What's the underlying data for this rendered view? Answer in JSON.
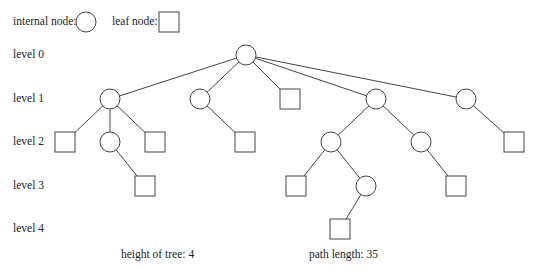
{
  "legend": {
    "internal_label": "internal node:",
    "leaf_label": "leaf node:"
  },
  "levels": [
    "level 0",
    "level 1",
    "level 2",
    "level 3",
    "level 4"
  ],
  "footer": {
    "height": "height of tree: 4",
    "path_length": "path length: 35"
  },
  "tree": {
    "nodes": [
      {
        "id": "r",
        "type": "internal",
        "x": 246,
        "y": 55
      },
      {
        "id": "a",
        "type": "internal",
        "x": 110,
        "y": 99
      },
      {
        "id": "b",
        "type": "internal",
        "x": 200,
        "y": 99
      },
      {
        "id": "c",
        "type": "leaf",
        "x": 290,
        "y": 99
      },
      {
        "id": "d",
        "type": "internal",
        "x": 376,
        "y": 99
      },
      {
        "id": "e",
        "type": "internal",
        "x": 466,
        "y": 99
      },
      {
        "id": "a1",
        "type": "leaf",
        "x": 65,
        "y": 142
      },
      {
        "id": "a2",
        "type": "internal",
        "x": 110,
        "y": 142
      },
      {
        "id": "a3",
        "type": "leaf",
        "x": 155,
        "y": 142
      },
      {
        "id": "b1",
        "type": "leaf",
        "x": 245,
        "y": 142
      },
      {
        "id": "d1",
        "type": "internal",
        "x": 331,
        "y": 142
      },
      {
        "id": "d2",
        "type": "internal",
        "x": 421,
        "y": 142
      },
      {
        "id": "e1",
        "type": "leaf",
        "x": 514,
        "y": 142
      },
      {
        "id": "a2a",
        "type": "leaf",
        "x": 145,
        "y": 186
      },
      {
        "id": "d1a",
        "type": "leaf",
        "x": 296,
        "y": 186
      },
      {
        "id": "d1b",
        "type": "internal",
        "x": 366,
        "y": 186
      },
      {
        "id": "d2a",
        "type": "leaf",
        "x": 456,
        "y": 186
      },
      {
        "id": "d1ba",
        "type": "leaf",
        "x": 340,
        "y": 229
      }
    ],
    "edges": [
      [
        "r",
        "a"
      ],
      [
        "r",
        "b"
      ],
      [
        "r",
        "c"
      ],
      [
        "r",
        "d"
      ],
      [
        "r",
        "e"
      ],
      [
        "a",
        "a1"
      ],
      [
        "a",
        "a2"
      ],
      [
        "a",
        "a3"
      ],
      [
        "b",
        "b1"
      ],
      [
        "d",
        "d1"
      ],
      [
        "d",
        "d2"
      ],
      [
        "e",
        "e1"
      ],
      [
        "a2",
        "a2a"
      ],
      [
        "d1",
        "d1a"
      ],
      [
        "d1",
        "d1b"
      ],
      [
        "d2",
        "d2a"
      ],
      [
        "d1b",
        "d1ba"
      ]
    ]
  }
}
